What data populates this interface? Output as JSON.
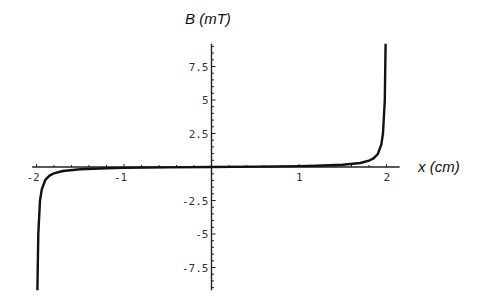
{
  "chart_data": {
    "type": "line",
    "title": "",
    "xlabel": "x (cm)",
    "ylabel": "B (mT)",
    "xlim": [
      -2,
      2
    ],
    "ylim": [
      -9.2,
      9.2
    ],
    "grid": false,
    "legend": null,
    "x_ticks": [
      "-2",
      "-1",
      "1",
      "2"
    ],
    "y_ticks": [
      "7.5",
      "5",
      "2.5",
      "-2.5",
      "-5",
      "-7.5"
    ],
    "series": [
      {
        "name": "B(x)",
        "x": [
          -1.99,
          -1.98,
          -1.96,
          -1.94,
          -1.9,
          -1.85,
          -1.8,
          -1.7,
          -1.5,
          -1.2,
          -1.0,
          -0.5,
          0,
          0.5,
          1.0,
          1.2,
          1.5,
          1.7,
          1.8,
          1.85,
          1.9,
          1.94,
          1.96,
          1.98,
          1.99
        ],
        "y": [
          -9.2,
          -5.0,
          -2.5,
          -1.67,
          -0.97,
          -0.64,
          -0.47,
          -0.3,
          -0.17,
          -0.096,
          -0.067,
          -0.027,
          0,
          0.027,
          0.067,
          0.096,
          0.17,
          0.3,
          0.47,
          0.64,
          0.97,
          1.67,
          2.5,
          5.0,
          9.2
        ]
      }
    ]
  }
}
